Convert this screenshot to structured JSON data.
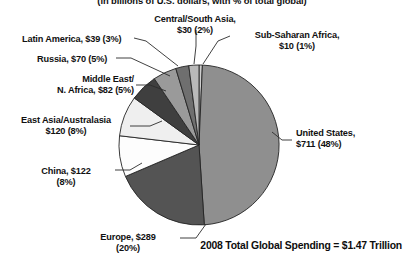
{
  "subtitle": "(in billions of U.S. dollars, with % of total global)",
  "footer": {
    "total_label": "2008 Total Global Spending = $1.47 Trillion"
  },
  "labels": {
    "latin_america": "Latin America, $39 (3%)",
    "russia": "Russia, $70 (5%)",
    "middle_east_l1": "Middle East/",
    "middle_east_l2": "N. Africa, $82 (5%)",
    "east_asia_l1": "East Asia/Australasia",
    "east_asia_l2": "$120 (8%)",
    "china_l1": "China, $122",
    "china_l2": "(8%)",
    "europe_l1": "Europe, $289",
    "europe_l2": "(20%)",
    "central_south_l1": "Central/South Asia,",
    "central_south_l2": "$30 (2%)",
    "subsaharan_l1": "Sub-Saharan Africa,",
    "subsaharan_l2": "$10 (1%)",
    "united_states_l1": "United States,",
    "united_states_l2": "$711 (48%)"
  },
  "chart_data": {
    "type": "pie",
    "title": "",
    "subtitle": "(in billions of U.S. dollars, with % of total global)",
    "unit": "billions of U.S. dollars",
    "total_label": "2008 Total Global Spending = $1.47 Trillion",
    "total_value": 1470,
    "legend": "none (direct labels with leader lines)",
    "start_angle_deg": 0,
    "direction": "clockwise",
    "categories": [
      "Sub-Saharan Africa",
      "United States",
      "Europe",
      "China",
      "East Asia/Australasia",
      "Middle East/N. Africa",
      "Russia",
      "Latin America",
      "Central/South Asia"
    ],
    "values": [
      10,
      711,
      289,
      122,
      120,
      82,
      70,
      39,
      30
    ],
    "percents": [
      1,
      48,
      20,
      8,
      8,
      5,
      5,
      3,
      2
    ],
    "colors": [
      "#cfcfcf",
      "#8f8f8f",
      "#545454",
      "#fdfdfd",
      "#efefef",
      "#3f3f3f",
      "#9a9a9a",
      "#6f6f6f",
      "#b9b9b9"
    ],
    "slices": [
      {
        "name": "Sub-Saharan Africa",
        "value": 10,
        "percent": 1,
        "label": "Sub-Saharan Africa, $10 (1%)",
        "color": "#cfcfcf"
      },
      {
        "name": "United States",
        "value": 711,
        "percent": 48,
        "label": "United States, $711 (48%)",
        "color": "#8f8f8f"
      },
      {
        "name": "Europe",
        "value": 289,
        "percent": 20,
        "label": "Europe, $289 (20%)",
        "color": "#545454"
      },
      {
        "name": "China",
        "value": 122,
        "percent": 8,
        "label": "China, $122 (8%)",
        "color": "#fdfdfd"
      },
      {
        "name": "East Asia/Australasia",
        "value": 120,
        "percent": 8,
        "label": "East Asia/Australasia $120 (8%)",
        "color": "#efefef"
      },
      {
        "name": "Middle East/N. Africa",
        "value": 82,
        "percent": 5,
        "label": "Middle East/ N. Africa, $82 (5%)",
        "color": "#3f3f3f"
      },
      {
        "name": "Russia",
        "value": 70,
        "percent": 5,
        "label": "Russia, $70 (5%)",
        "color": "#9a9a9a"
      },
      {
        "name": "Latin America",
        "value": 39,
        "percent": 3,
        "label": "Latin America, $39 (3%)",
        "color": "#6f6f6f"
      },
      {
        "name": "Central/South Asia",
        "value": 30,
        "percent": 2,
        "label": "Central/South Asia, $30 (2%)",
        "color": "#b9b9b9"
      }
    ]
  }
}
